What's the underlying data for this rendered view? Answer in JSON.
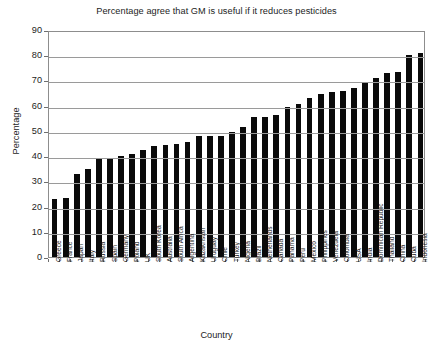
{
  "chart_data": {
    "type": "bar",
    "title": "Percentage agree that GM is useful if it reduces pesticides",
    "xlabel": "Country",
    "ylabel": "Percentage",
    "ylim": [
      0,
      90
    ],
    "ytick_step": 10,
    "yticks": [
      "0",
      "10",
      "20",
      "30",
      "40",
      "50",
      "60",
      "70",
      "80",
      "90"
    ],
    "grid": true,
    "legend": "none",
    "bar_color": "#0a0a0a",
    "categories": [
      "Greece",
      "France",
      "Japan",
      "Italy",
      "Russia",
      "Spain",
      "Germany",
      "Poland",
      "UK",
      "South Korea",
      "Australia",
      "South Africa",
      "Argentina",
      "Kazakhstan",
      "Uruguay",
      "Chile",
      "Turkey",
      "Nigeria",
      "Brazil",
      "Netherlands",
      "Canada",
      "Panama",
      "Peru",
      "Mexico",
      "Philippines",
      "Venezuela",
      "Colombia",
      "USA",
      "India",
      "Dominican Republic",
      "Thailand",
      "China",
      "Cuba",
      "Indonesia"
    ],
    "values": [
      23,
      23.5,
      33,
      35,
      39,
      39,
      40,
      41,
      42.5,
      44,
      44.5,
      45,
      45.5,
      48,
      48,
      48,
      49.5,
      51.5,
      55.5,
      55.5,
      56.5,
      59.5,
      60.5,
      63,
      64.5,
      65.5,
      66,
      67,
      69,
      71,
      73,
      73.5,
      80,
      81
    ]
  }
}
